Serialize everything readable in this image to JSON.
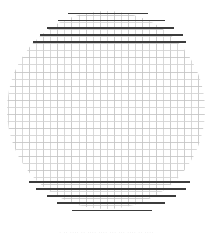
{
  "figure": {
    "kind": "scanned-circular-wire-mesh-grid",
    "title": "",
    "background_color": "#ffffff",
    "caption_text": "· ·· ···· ·· ···· ···· ··· ··· ···· ·· ····",
    "caption_legible": false
  },
  "chart_data": {
    "type": "scatter",
    "title": "",
    "subtitle": "",
    "xlabel": "",
    "ylabel": "",
    "grid": true,
    "legend_position": "none",
    "xlim": [
      0,
      213
    ],
    "ylim": [
      0,
      238
    ],
    "tick_labels_x": [],
    "tick_labels_y": [],
    "annotations": [],
    "circle": {
      "center_x": 106,
      "center_y": 110,
      "radius": 99,
      "clip_top": 0,
      "clip_bottom": 223
    },
    "grid_spacing_px": 7.05,
    "grid_origin_offset_px": 1.5,
    "grid_color_light": "#d2d2d2",
    "grid_color_light_alt": "#c4c4c4",
    "grid_line_width_light": 0.85,
    "grid_color_dark": "#3c3c3c",
    "grid_line_width_dark": 1.45,
    "series": [
      {
        "name": "dark-horizontal-bands-top",
        "values": [
          {
            "y": 13.6,
            "x_start": 68.0,
            "x_end": 148.0
          },
          {
            "y": 20.7,
            "x_start": 58.0,
            "x_end": 165.0
          },
          {
            "y": 27.8,
            "x_start": 47.0,
            "x_end": 174.0
          },
          {
            "y": 34.8,
            "x_start": 40.0,
            "x_end": 183.0
          },
          {
            "y": 41.9,
            "x_start": 33.0,
            "x_end": 186.0
          }
        ]
      },
      {
        "name": "dark-horizontal-bands-bottom",
        "values": [
          {
            "y": 182.0,
            "x_start": 29.0,
            "x_end": 190.0
          },
          {
            "y": 189.1,
            "x_start": 36.0,
            "x_end": 186.0
          },
          {
            "y": 196.1,
            "x_start": 47.0,
            "x_end": 176.0
          },
          {
            "y": 203.2,
            "x_start": 57.0,
            "x_end": 165.0
          },
          {
            "y": 210.3,
            "x_start": 72.0,
            "x_end": 152.0
          }
        ]
      }
    ]
  }
}
